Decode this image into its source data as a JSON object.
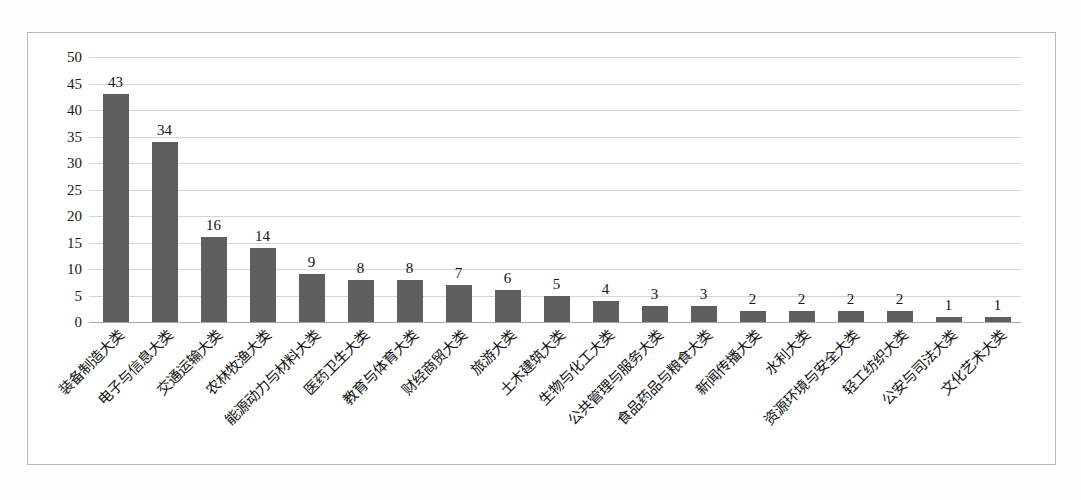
{
  "chart_data": {
    "type": "bar",
    "title": "",
    "subtitle": "",
    "xlabel": "",
    "ylabel": "",
    "ylim": [
      0,
      50
    ],
    "yticks": [
      0,
      5,
      10,
      15,
      20,
      25,
      30,
      35,
      40,
      45,
      50
    ],
    "grid": true,
    "legend": false,
    "legend_position": "none",
    "orientation": "vertical",
    "bar_color": "#5f5f5f",
    "gridline_color": "#d6d6d6",
    "axis_color": "#a8a8a8",
    "data_labels_shown": true,
    "categories": [
      "装备制造大类",
      "电子与信息大类",
      "交通运输大类",
      "农林牧渔大类",
      "能源动力与材料大类",
      "医药卫生大类",
      "教育与体育大类",
      "财经商贸大类",
      "旅游大类",
      "土木建筑大类",
      "生物与化工大类",
      "公共管理与服务大类",
      "食品药品与粮食大类",
      "新闻传播大类",
      "水利大类",
      "资源环境与安全大类",
      "轻工纺织大类",
      "公安与司法大类",
      "文化艺术大类"
    ],
    "values": [
      43,
      34,
      16,
      14,
      9,
      8,
      8,
      7,
      6,
      5,
      4,
      3,
      3,
      2,
      2,
      2,
      2,
      1,
      1
    ],
    "value_labels": [
      "43",
      "34",
      "16",
      "14",
      "9",
      "8",
      "8",
      "7",
      "6",
      "5",
      "4",
      "3",
      "3",
      "2",
      "2",
      "2",
      "2",
      "1",
      "1"
    ],
    "ytick_labels": [
      "0",
      "5",
      "10",
      "15",
      "20",
      "25",
      "30",
      "35",
      "40",
      "45",
      "50"
    ]
  }
}
